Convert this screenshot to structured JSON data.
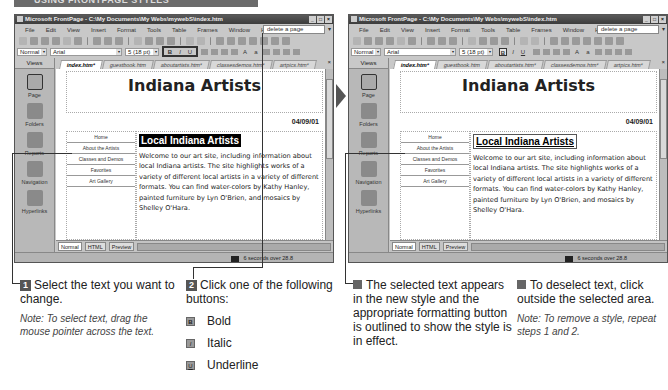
{
  "banner": {
    "text": "USING FRONTPAGE STYLES"
  },
  "windows": [
    {
      "id": "before",
      "title": "Microsoft FrontPage - C:\\My Documents\\My Webs\\mywebS\\index.htm",
      "menu": [
        "File",
        "Edit",
        "View",
        "Insert",
        "Format",
        "Tools",
        "Table",
        "Frames",
        "Window",
        "Help"
      ],
      "help_box": "delete a page",
      "style": "Normal",
      "font": "Arial",
      "size": "5 (18 pt)",
      "format_buttons": [
        "B",
        "I",
        "U"
      ],
      "views_label": "Views",
      "views": [
        "Page",
        "Folders",
        "Reports",
        "Navigation",
        "Hyperlinks"
      ],
      "tabs": [
        "index.htm*",
        "guestbook.htm",
        "aboutartists.htm*",
        "classesdemos.htm*",
        "artpics.htm*"
      ],
      "page_title": "Indiana Artists",
      "date": "04/09/01",
      "nav_items": [
        "Home",
        "About the Artists",
        "Classes and Demos",
        "Favorites",
        "Art Gallery"
      ],
      "heading": "Local Indiana Artists",
      "paragraph": "Welcome to our art site, including information about local Indiana artists. The site highlights works of a variety of different local artists in a variety of different formats. You can find water-colors by Kathy Hanley, painted furniture by Lyn O'Brien, and mosaics by Shelley O'Hara.",
      "view_tabs": [
        "Normal",
        "HTML",
        "Preview"
      ],
      "status": "6 seconds over 28.8"
    },
    {
      "id": "after",
      "title": "Microsoft FrontPage - C:\\My Documents\\My Webs\\mywebS\\index.htm",
      "menu": [
        "File",
        "Edit",
        "View",
        "Insert",
        "Format",
        "Tools",
        "Table",
        "Frames",
        "Window",
        "Help"
      ],
      "help_box": "delete a page",
      "style": "Normal",
      "font": "Arial",
      "size": "5 (18 pt)",
      "format_buttons": [
        "B",
        "I",
        "U"
      ],
      "views_label": "Views",
      "views": [
        "Page",
        "Folders",
        "Reports",
        "Navigation",
        "Hyperlinks"
      ],
      "tabs": [
        "index.htm*",
        "guestbook.htm",
        "aboutartists.htm*",
        "classesdemos.htm*",
        "artpics.htm*"
      ],
      "page_title": "Indiana Artists",
      "date": "04/09/01",
      "nav_items": [
        "Home",
        "About the Artists",
        "Classes and Demos",
        "Favorites",
        "Art Gallery"
      ],
      "heading": "Local Indiana Artists",
      "paragraph": "Welcome to our art site, including information about local Indiana artists. The site highlights works of a variety of different local artists in a variety of different formats. You can find water-colors by Kathy Hanley, painted furniture by Lyn O'Brien, and mosaics by Shelley O'Hara.",
      "view_tabs": [
        "Normal",
        "HTML",
        "Preview"
      ],
      "status": "6 seconds over 28.8"
    }
  ],
  "steps": {
    "step1": {
      "num": "1",
      "text": "Select the text you want to change.",
      "note": "Note: To select text, drag the mouse pointer across the text."
    },
    "step2": {
      "num": "2",
      "text": "Click one of the following buttons:",
      "buttons": [
        {
          "icon": "B",
          "label": "Bold"
        },
        {
          "icon": "I",
          "label": "Italic"
        },
        {
          "icon": "U",
          "label": "Underline"
        }
      ]
    },
    "result": {
      "text": "The selected text appears in the new style and the appropriate formatting button is outlined to show the style is in effect."
    },
    "deselect": {
      "text": "To deselect text, click outside the selected area.",
      "note": "Note: To remove a style, repeat steps 1 and 2."
    }
  }
}
